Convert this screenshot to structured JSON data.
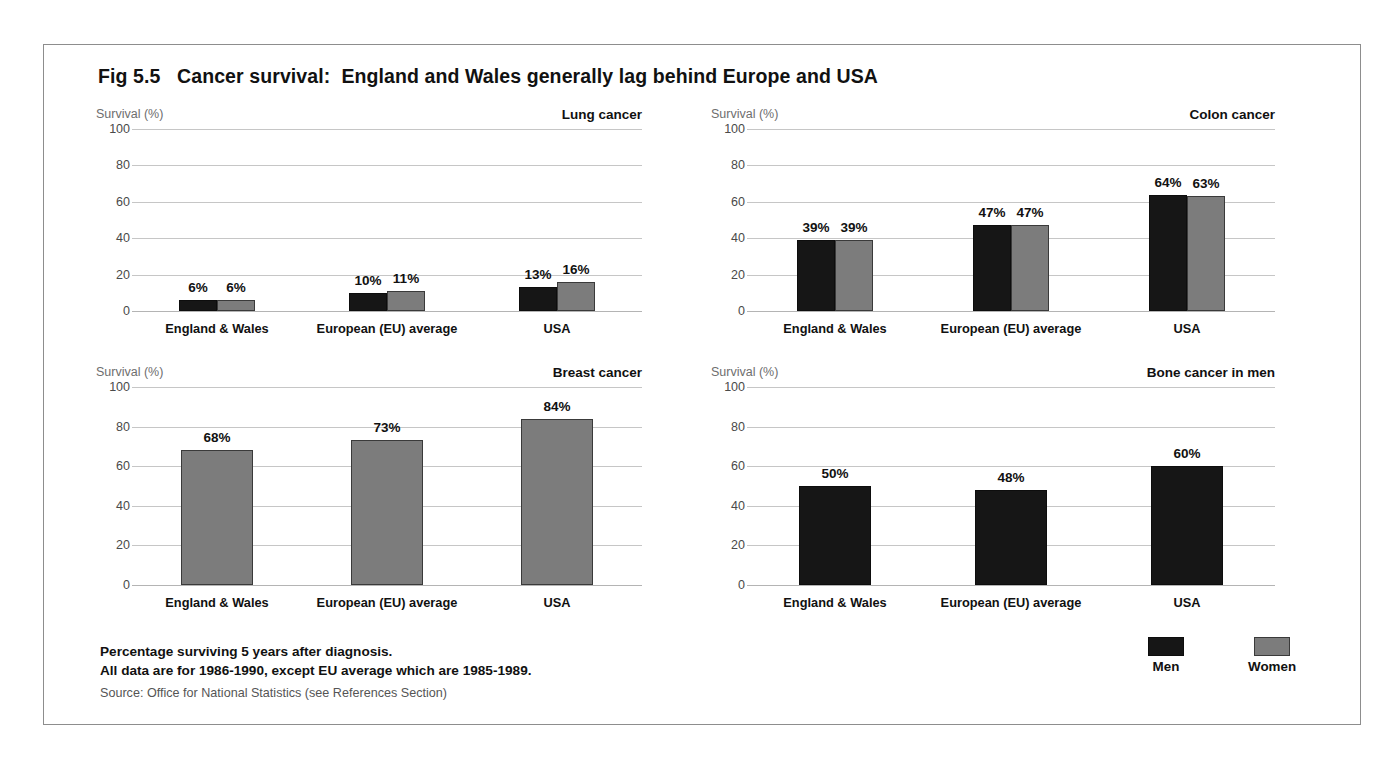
{
  "figure": {
    "title": "Fig 5.5   Cancer survival:  England and Wales generally lag behind Europe and USA"
  },
  "axis_unit_label": "Survival (%)",
  "categories": [
    "England & Wales",
    "European (EU) average",
    "USA"
  ],
  "legend": {
    "position": "bottom-right",
    "items": [
      {
        "label": "Men",
        "color": "#161616"
      },
      {
        "label": "Women",
        "color": "#7c7c7c"
      }
    ]
  },
  "footnotes": {
    "line1": "Percentage surviving 5 years after diagnosis.",
    "line2": "All data are for 1986-1990, except EU average which are 1985-1989.",
    "source": "Source: Office for National Statistics (see References Section)"
  },
  "chart_data": [
    {
      "type": "bar",
      "title": "Lung cancer",
      "xlabel": "",
      "ylabel": "Survival (%)",
      "ylim": [
        0,
        100
      ],
      "yticks": [
        0,
        20,
        40,
        60,
        80,
        100
      ],
      "ytick_labels": [
        "0",
        "20",
        "40",
        "60",
        "80",
        "100"
      ],
      "grid": true,
      "categories": [
        "England & Wales",
        "European (EU) average",
        "USA"
      ],
      "series": [
        {
          "name": "Men",
          "values": [
            6,
            10,
            13
          ],
          "labels": [
            "6%",
            "10%",
            "13%"
          ],
          "color": "#161616"
        },
        {
          "name": "Women",
          "values": [
            6,
            11,
            16
          ],
          "labels": [
            "6%",
            "11%",
            "16%"
          ],
          "color": "#7c7c7c"
        }
      ]
    },
    {
      "type": "bar",
      "title": "Colon cancer",
      "xlabel": "",
      "ylabel": "Survival (%)",
      "ylim": [
        0,
        100
      ],
      "yticks": [
        0,
        20,
        40,
        60,
        80,
        100
      ],
      "ytick_labels": [
        "0",
        "20",
        "40",
        "60",
        "80",
        "100"
      ],
      "grid": true,
      "categories": [
        "England & Wales",
        "European (EU) average",
        "USA"
      ],
      "series": [
        {
          "name": "Men",
          "values": [
            39,
            47,
            64
          ],
          "labels": [
            "39%",
            "47%",
            "64%"
          ],
          "color": "#161616"
        },
        {
          "name": "Women",
          "values": [
            39,
            47,
            63
          ],
          "labels": [
            "39%",
            "47%",
            "63%"
          ],
          "color": "#7c7c7c"
        }
      ]
    },
    {
      "type": "bar",
      "title": "Breast cancer",
      "xlabel": "",
      "ylabel": "Survival (%)",
      "ylim": [
        0,
        100
      ],
      "yticks": [
        0,
        20,
        40,
        60,
        80,
        100
      ],
      "ytick_labels": [
        "0",
        "20",
        "40",
        "60",
        "80",
        "100"
      ],
      "grid": true,
      "categories": [
        "England & Wales",
        "European (EU) average",
        "USA"
      ],
      "series": [
        {
          "name": "Women",
          "values": [
            68,
            73,
            84
          ],
          "labels": [
            "68%",
            "73%",
            "84%"
          ],
          "color": "#7c7c7c"
        }
      ]
    },
    {
      "type": "bar",
      "title": "Bone cancer in men",
      "xlabel": "",
      "ylabel": "Survival (%)",
      "ylim": [
        0,
        100
      ],
      "yticks": [
        0,
        20,
        40,
        60,
        80,
        100
      ],
      "ytick_labels": [
        "0",
        "20",
        "40",
        "60",
        "80",
        "100"
      ],
      "grid": true,
      "categories": [
        "England & Wales",
        "European (EU) average",
        "USA"
      ],
      "series": [
        {
          "name": "Men",
          "values": [
            50,
            48,
            60
          ],
          "labels": [
            "50%",
            "48%",
            "60%"
          ],
          "color": "#161616"
        }
      ]
    }
  ]
}
